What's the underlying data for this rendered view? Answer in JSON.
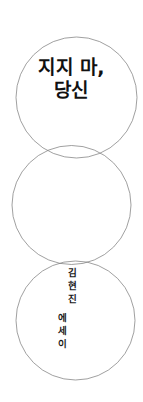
{
  "cover": {
    "title": {
      "line1": "지지 마,",
      "line2": "당신"
    },
    "author": "김현진",
    "genre": "에세이",
    "colors": {
      "background": "#ffffff",
      "circle_stroke": "#777777",
      "title_text": "#111111",
      "vertical_text": "#1a1a1a"
    }
  }
}
